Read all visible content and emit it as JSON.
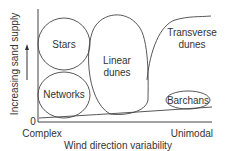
{
  "diagram": {
    "type": "dune-classification",
    "y_axis": {
      "label": "Increasing sand supply",
      "origin_label": "0"
    },
    "x_axis": {
      "label": "Wind direction variability",
      "left_label": "Complex",
      "right_label": "Unimodal"
    },
    "regions": [
      {
        "name": "Stars",
        "label": "Stars"
      },
      {
        "name": "Networks",
        "label": "Networks"
      },
      {
        "name": "Linear dunes",
        "label_line1": "Linear",
        "label_line2": "dunes"
      },
      {
        "name": "Transverse dunes",
        "label_line1": "Transverse",
        "label_line2": "dunes"
      },
      {
        "name": "Barchans",
        "label": "Barchans"
      }
    ],
    "colors": {
      "line": "#444444",
      "text": "#333333",
      "background": "#ffffff"
    }
  }
}
